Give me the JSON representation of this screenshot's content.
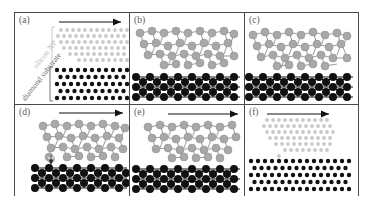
{
  "figure": {
    "caption_labels": [
      "(a)",
      "(b)",
      "(c)",
      "(d)",
      "(e)",
      "(f)"
    ],
    "annotations": {
      "nanoparticle_label": "silicon NP",
      "substrate_label": "diamond substrate"
    },
    "colors": {
      "nanoparticle_atom": "#a8a8a8",
      "nanoparticle_atom_light": "#cfcfcf",
      "substrate_atom": "#111111",
      "bond": "#8c8c8c",
      "bond_dark": "#111111",
      "frame": "#4a4a4a",
      "label": "#5c5c5c",
      "annotation_light": "#b9b9b9",
      "annotation_dark": "#6e6e6e",
      "arrow": "#111111",
      "background": "#ffffff"
    },
    "arrow_panels": [
      "(a)",
      "(d)",
      "(e)",
      "(f)"
    ],
    "transfer_arrow_panel": "(d)"
  },
  "panels": [
    {
      "id": "a",
      "label": "(a)",
      "render_style": "dots",
      "has_slide_arrow": true,
      "has_transfer_arrow": false,
      "nanoparticle": {
        "style": "small-dots",
        "rows": 6,
        "shape": "trapezoid-wedge"
      },
      "substrate": {
        "style": "small-dots",
        "rows": 5
      },
      "side_annotations": [
        "silicon NP",
        "diamond substrate"
      ]
    },
    {
      "id": "b",
      "label": "(b)",
      "render_style": "balls-and-sticks",
      "has_slide_arrow": false,
      "has_transfer_arrow": false,
      "nanoparticle": {
        "style": "amorphous-network",
        "atom_count": 28
      },
      "substrate": {
        "style": "crystal-lattice",
        "rows": 3
      },
      "side_annotations": []
    },
    {
      "id": "c",
      "label": "(c)",
      "render_style": "balls-and-sticks",
      "has_slide_arrow": false,
      "has_transfer_arrow": false,
      "nanoparticle": {
        "style": "amorphous-network",
        "atom_count": 27
      },
      "substrate": {
        "style": "crystal-lattice",
        "rows": 3
      },
      "side_annotations": []
    },
    {
      "id": "d",
      "label": "(d)",
      "render_style": "balls-and-sticks",
      "has_slide_arrow": true,
      "has_transfer_arrow": true,
      "nanoparticle": {
        "style": "amorphous-network",
        "atom_count": 28
      },
      "substrate": {
        "style": "crystal-lattice",
        "rows": 3
      },
      "side_annotations": []
    },
    {
      "id": "e",
      "label": "(e)",
      "render_style": "balls-and-sticks",
      "has_slide_arrow": true,
      "has_transfer_arrow": false,
      "nanoparticle": {
        "style": "amorphous-network",
        "atom_count": 26
      },
      "substrate": {
        "style": "crystal-lattice",
        "rows": 3
      },
      "side_annotations": []
    },
    {
      "id": "f",
      "label": "(f)",
      "render_style": "dots",
      "has_slide_arrow": true,
      "has_transfer_arrow": false,
      "nanoparticle": {
        "style": "small-dots",
        "rows": 6,
        "shape": "trapezoid-wedge"
      },
      "substrate": {
        "style": "small-dots",
        "rows": 5
      },
      "side_annotations": []
    }
  ]
}
